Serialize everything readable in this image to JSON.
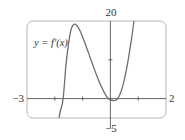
{
  "chart_data": {
    "type": "line",
    "title": "",
    "xlabel": "",
    "ylabel": "",
    "xlim": [
      -3,
      2
    ],
    "ylim": [
      -5,
      20
    ],
    "grid": false,
    "legend": null,
    "tick_labels": {
      "x_min": "−3",
      "x_max": "2",
      "y_max": "20",
      "y_min": "−5"
    },
    "x_ticks": [
      -2,
      -1,
      0,
      1
    ],
    "y_ticks": [
      10
    ],
    "series": [
      {
        "name": "y = f′(x)",
        "x": [
          -1.85,
          -1.8,
          -1.7,
          -1.6,
          -1.5,
          -1.4,
          -1.28,
          -1.2,
          -1.1,
          -1.0,
          -0.9,
          -0.8,
          -0.7,
          -0.6,
          -0.5,
          -0.4,
          -0.3,
          -0.2,
          -0.1,
          0.0,
          0.1,
          0.15,
          0.25,
          0.35,
          0.45,
          0.55,
          0.65,
          0.75,
          0.85
        ],
        "y": [
          -5,
          -3.2,
          0,
          8.5,
          14.5,
          18.2,
          19.2,
          18.8,
          17.6,
          15.9,
          14.0,
          12.0,
          10.0,
          8.0,
          6.1,
          4.3,
          2.7,
          1.3,
          0.2,
          -0.3,
          -0.5,
          -0.5,
          -0.1,
          1.2,
          3.4,
          6.5,
          10.4,
          15.0,
          20
        ]
      }
    ],
    "annotations": [
      {
        "text": "y = f′(x)",
        "x": -2.6,
        "y": 15
      }
    ]
  },
  "labels": {
    "x_min": "−3",
    "x_max": "2",
    "y_max": "20",
    "y_min": "−5",
    "curve": "y = f′(x)"
  },
  "colors": {
    "curve": "#6e6e6e",
    "axis": "#555555",
    "frame": "#b5b5b5",
    "text": "#333333"
  }
}
